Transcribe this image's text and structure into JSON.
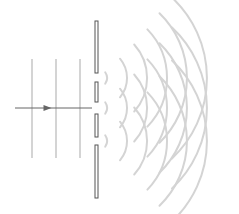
{
  "diagram": {
    "title": "",
    "type": "diffraction-grating",
    "colors": {
      "background": "#ffffff",
      "barrier_fill": "#ffffff",
      "barrier_stroke": "#555555",
      "wavefront": "#d4d4d4",
      "arrow": "#666666"
    },
    "incident_wavefronts_x": [
      32,
      56,
      80
    ],
    "incident_wavefront_y_range": [
      59,
      158
    ],
    "arrow": {
      "x1": 15,
      "x2": 92,
      "y": 108
    },
    "barrier": {
      "x": 95,
      "width": 3,
      "segments": [
        {
          "y1": 21,
          "y2": 73
        },
        {
          "y1": 82,
          "y2": 102
        },
        {
          "y1": 114,
          "y2": 137
        },
        {
          "y1": 145,
          "y2": 198
        }
      ]
    },
    "slits_y": [
      78,
      108,
      141
    ],
    "slit_x": 97,
    "diffracted_arc_radii": [
      10,
      30,
      50,
      70,
      90,
      110
    ],
    "diffracted_arc_half_angles_deg": [
      35,
      40,
      42,
      44,
      46,
      47
    ]
  }
}
